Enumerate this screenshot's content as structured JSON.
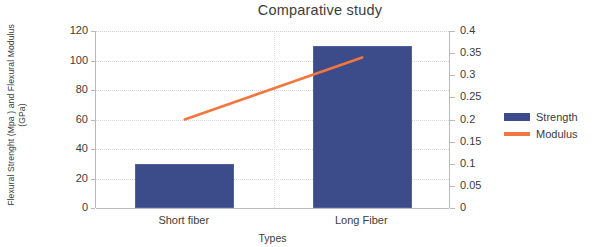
{
  "title": "Comparative study",
  "axis": {
    "y_left_label_line1": "Flexural Strenght (Mpa ) and Flexural Modulus",
    "y_left_label_line2": "(GPa)",
    "x_label": "Types"
  },
  "legend": {
    "items": [
      {
        "label": "Strength",
        "type": "bar",
        "color": "#3c4b8a"
      },
      {
        "label": "Modulus",
        "type": "line",
        "color": "#f2763f"
      }
    ]
  },
  "colors": {
    "bar": "#3c4b8a",
    "line": "#f2763f",
    "axis": "#b9b9b9",
    "grid": "#d6d6d6",
    "text": "#3c3c3c",
    "background": "#ffffff"
  },
  "chart_data": {
    "type": "bar",
    "title": "Comparative study",
    "xlabel": "Types",
    "ylabel": "Flexural Strenght (Mpa ) and Flexural Modulus (GPa)",
    "categories": [
      "Short fiber",
      "Long Fiber"
    ],
    "series": [
      {
        "name": "Strength",
        "type": "bar",
        "axis": "left",
        "unit": "MPa",
        "values": [
          30,
          110
        ],
        "color": "#3c4b8a"
      },
      {
        "name": "Modulus",
        "type": "line",
        "axis": "right",
        "unit": "GPa",
        "values": [
          0.2,
          0.34
        ],
        "color": "#f2763f"
      }
    ],
    "ylim": [
      0,
      120
    ],
    "yticks": [
      0,
      20,
      40,
      60,
      80,
      100,
      120
    ],
    "ytick_labels": [
      "0",
      "20",
      "40",
      "60",
      "80",
      "100",
      "120"
    ],
    "y2lim": [
      0,
      0.4
    ],
    "y2ticks": [
      0,
      0.05,
      0.1,
      0.15,
      0.2,
      0.25,
      0.3,
      0.35,
      0.4
    ],
    "y2tick_labels": [
      "0",
      "0.05",
      "0.1",
      "0.15",
      "0.2",
      "0.25",
      "0.3",
      "0.35",
      "0.4"
    ],
    "grid": true,
    "legend_position": "right"
  }
}
